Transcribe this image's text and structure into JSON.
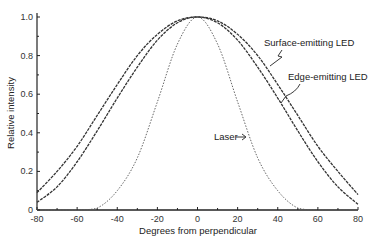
{
  "chart_data": {
    "type": "line",
    "title": "",
    "xlabel": "Degrees from perpendicular",
    "ylabel": "Relative intensity",
    "xlim": [
      -80,
      80
    ],
    "ylim": [
      0,
      1.0
    ],
    "grid": false,
    "legend_position": "inline annotations",
    "x_ticks": [
      "-80",
      "-60",
      "-40",
      "-20",
      "0",
      "20",
      "40",
      "60",
      "80"
    ],
    "y_ticks": [
      "0",
      "0.2",
      "0.4",
      "0.6",
      "0.8",
      "1.0"
    ],
    "x": [
      -80,
      -70,
      -60,
      -50,
      -40,
      -30,
      -20,
      -10,
      0,
      10,
      20,
      30,
      40,
      50,
      60,
      70,
      80
    ],
    "series": [
      {
        "name": "Surface-emitting LED",
        "values": [
          0.09,
          0.2,
          0.33,
          0.49,
          0.65,
          0.8,
          0.91,
          0.98,
          1.0,
          0.98,
          0.91,
          0.8,
          0.65,
          0.49,
          0.33,
          0.2,
          0.08
        ]
      },
      {
        "name": "Edge-emitting LED",
        "values": [
          0.04,
          0.12,
          0.25,
          0.41,
          0.58,
          0.74,
          0.88,
          0.97,
          1.0,
          0.97,
          0.88,
          0.74,
          0.58,
          0.41,
          0.25,
          0.12,
          0.03
        ]
      },
      {
        "name": "Laser",
        "values": [
          0.0,
          0.0,
          0.0,
          0.01,
          0.1,
          0.27,
          0.56,
          0.86,
          1.0,
          0.86,
          0.56,
          0.27,
          0.1,
          0.01,
          0.0,
          0.0,
          0.0
        ]
      }
    ],
    "annotations": [
      {
        "text": "Surface-emitting LED",
        "points_to": "Surface-emitting LED"
      },
      {
        "text": "Edge-emitting LED",
        "points_to": "Edge-emitting LED"
      },
      {
        "text": "Laser",
        "points_to": "Laser"
      }
    ]
  }
}
